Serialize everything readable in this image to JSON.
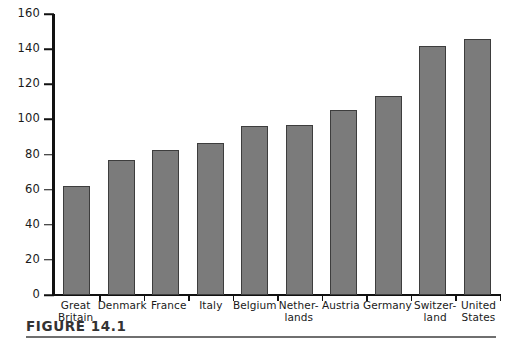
{
  "figure": {
    "caption": "FIGURE 14.1"
  },
  "chart_data": {
    "type": "bar",
    "title": "",
    "xlabel": "",
    "ylabel": "",
    "ylim": [
      0,
      160
    ],
    "ytick_step": 20,
    "grid": false,
    "legend": "none",
    "bar_color": "#7b7b7b",
    "bar_border_color": "#3d3d3d",
    "axis_color": "#111111",
    "categories": [
      "Great\nBritain",
      "Denmark",
      "France",
      "Italy",
      "Belgium",
      "Nether-\nlands",
      "Austria",
      "Germany",
      "Switzer-\nland",
      "United\nStates"
    ],
    "values": [
      62,
      77,
      82.5,
      86.5,
      96,
      97,
      105.5,
      113.5,
      142,
      146
    ],
    "yticks": [
      0,
      20,
      40,
      60,
      80,
      100,
      120,
      140,
      160
    ],
    "ytick_labels": [
      "0",
      "20",
      "40",
      "60",
      "80",
      "100",
      "120",
      "140",
      "160"
    ]
  }
}
